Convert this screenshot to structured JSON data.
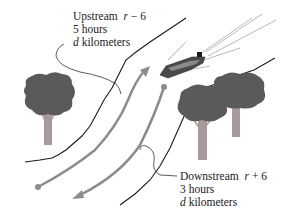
{
  "diagram": {
    "colors": {
      "bank_line": "#1a1a1a",
      "arrow": "#8c8c8c",
      "tree_foliage": "#5a5a5a",
      "tree_trunk": "#a89a9a",
      "boat_hull": "#4a4a4a",
      "wake": "#b0b0b0",
      "leader_line": "#333333",
      "text": "#222222"
    },
    "upstream": {
      "title": "Upstream",
      "rate_var": "r",
      "rate_op": "− 6",
      "time": "5 hours",
      "distance_var": "d",
      "distance_unit": "kilometers"
    },
    "downstream": {
      "title": "Downstream",
      "rate_var": "r",
      "rate_op": "+ 6",
      "time": "3 hours",
      "distance_var": "d",
      "distance_unit": "kilometers"
    },
    "elements": {
      "trees": 3,
      "boats": 1,
      "arrows": [
        "upstream-arrow",
        "downstream-arrow"
      ]
    }
  }
}
